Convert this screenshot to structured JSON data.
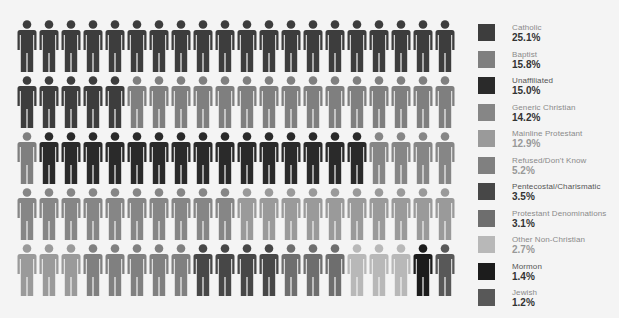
{
  "chart_data": {
    "type": "pictogram",
    "title": "",
    "units_total": 100,
    "grid": {
      "rows": 5,
      "columns": 20
    },
    "legend_position": "right",
    "categories": [
      {
        "name": "Catholic",
        "percent": "25.1%",
        "value": 25.1,
        "icons": 25,
        "color": "#3d3d3d"
      },
      {
        "name": "Baptist",
        "percent": "15.8%",
        "value": 15.8,
        "icons": 16,
        "color": "#7f7f7f"
      },
      {
        "name": "Unaffiliated",
        "percent": "15.0%",
        "value": 15.0,
        "icons": 15,
        "color": "#2a2a2a"
      },
      {
        "name": "Generic Christian",
        "percent": "14.2%",
        "value": 14.2,
        "icons": 14,
        "color": "#868686"
      },
      {
        "name": "Mainline Protestant",
        "percent": "12.9%",
        "value": 12.9,
        "icons": 13,
        "color": "#9a9a9a"
      },
      {
        "name": "Refused/Don't Know",
        "percent": "5.2%",
        "value": 5.2,
        "icons": 5,
        "color": "#808080"
      },
      {
        "name": "Pentecostal/Charismatic",
        "percent": "3.5%",
        "value": 3.5,
        "icons": 4,
        "color": "#474747"
      },
      {
        "name": "Protestant Denominations",
        "percent": "3.1%",
        "value": 3.1,
        "icons": 3,
        "color": "#6e6e6e"
      },
      {
        "name": "Other Non-Christian",
        "percent": "2.7%",
        "value": 2.7,
        "icons": 3,
        "color": "#b8b8b8"
      },
      {
        "name": "Mormon",
        "percent": "1.4%",
        "value": 1.4,
        "icons": 1,
        "color": "#1c1c1c"
      },
      {
        "name": "Jewish",
        "percent": "1.2%",
        "value": 1.2,
        "icons": 1,
        "color": "#585858"
      }
    ]
  },
  "legend": {
    "items": [
      {
        "label": "Catholic",
        "value": "25.1%",
        "color": "#3d3d3d",
        "label_dark": false,
        "value_light": false
      },
      {
        "label": "Baptist",
        "value": "15.8%",
        "color": "#7f7f7f",
        "label_dark": false,
        "value_light": false
      },
      {
        "label": "Unaffiliated",
        "value": "15.0%",
        "color": "#2a2a2a",
        "label_dark": true,
        "value_light": false
      },
      {
        "label": "Generic Christian",
        "value": "14.2%",
        "color": "#868686",
        "label_dark": false,
        "value_light": false
      },
      {
        "label": "Mainline Protestant",
        "value": "12.9%",
        "color": "#9a9a9a",
        "label_dark": false,
        "value_light": true
      },
      {
        "label": "Refused/Don't Know",
        "value": "5.2%",
        "color": "#808080",
        "label_dark": false,
        "value_light": true
      },
      {
        "label": "Pentecostal/Charismatic",
        "value": "3.5%",
        "color": "#474747",
        "label_dark": true,
        "value_light": false
      },
      {
        "label": "Protestant Denominations",
        "value": "3.1%",
        "color": "#6e6e6e",
        "label_dark": false,
        "value_light": false
      },
      {
        "label": "Other Non-Christian",
        "value": "2.7%",
        "color": "#b8b8b8",
        "label_dark": false,
        "value_light": true
      },
      {
        "label": "Mormon",
        "value": "1.4%",
        "color": "#1c1c1c",
        "label_dark": true,
        "value_light": false
      },
      {
        "label": "Jewish",
        "value": "1.2%",
        "color": "#585858",
        "label_dark": false,
        "value_light": false
      }
    ]
  }
}
